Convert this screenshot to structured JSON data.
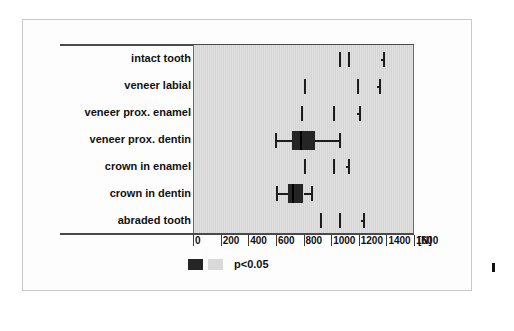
{
  "figure": {
    "panel_color": "#d4d4d4",
    "frame_color": "#c9c9c9",
    "box_color": "#252525"
  },
  "legend": {
    "swatch_dark_name": "significant-dark-swatch",
    "swatch_light_name": "nonsignificant-light-swatch",
    "text": "p<0.05"
  },
  "axis": {
    "unit": "[N]",
    "ticks": [
      "0",
      "200",
      "400",
      "600",
      "800",
      "1000",
      "1200",
      "1400",
      "1600"
    ]
  },
  "caption": {
    "fragment": ""
  },
  "chart_data": {
    "type": "box",
    "title": "",
    "xlabel": "[N]",
    "ylabel": "",
    "xlim": [
      0,
      1600
    ],
    "xticks": [
      0,
      200,
      400,
      600,
      800,
      1000,
      1200,
      1400,
      1600
    ],
    "grid": false,
    "legend": "p<0.05",
    "orientation": "horizontal",
    "categories": [
      "intact tooth",
      "veneer labial",
      "veneer prox. enamel",
      "veneer prox. dentin",
      "crown in enamel",
      "crown in dentin",
      "abraded tooth"
    ],
    "boxes": [
      {
        "category": "intact tooth",
        "whisker_low": 1055,
        "q1": 1070,
        "median": 1125,
        "q3": 1360,
        "whisker_high": 1375,
        "filled": false
      },
      {
        "category": "veneer labial",
        "whisker_low": 800,
        "q1": 815,
        "median": 1190,
        "q3": 1330,
        "whisker_high": 1345,
        "filled": false
      },
      {
        "category": "veneer prox. enamel",
        "whisker_low": 780,
        "q1": 795,
        "median": 1015,
        "q3": 1185,
        "whisker_high": 1200,
        "filled": false
      },
      {
        "category": "veneer prox. dentin",
        "whisker_low": 595,
        "q1": 720,
        "median": 775,
        "q3": 885,
        "whisker_high": 1055,
        "filled": true
      },
      {
        "category": "crown in enamel",
        "whisker_low": 800,
        "q1": 815,
        "median": 1015,
        "q3": 1110,
        "whisker_high": 1125,
        "filled": false
      },
      {
        "category": "crown in dentin",
        "whisker_low": 600,
        "q1": 690,
        "median": 715,
        "q3": 800,
        "whisker_high": 855,
        "filled": true
      },
      {
        "category": "abraded tooth",
        "whisker_low": 920,
        "q1": 935,
        "median": 1055,
        "q3": 1215,
        "whisker_high": 1230,
        "filled": false
      }
    ]
  }
}
